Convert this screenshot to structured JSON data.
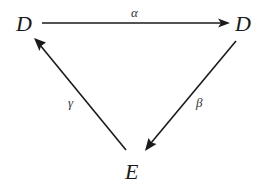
{
  "diagram": {
    "type": "commutative-triangle",
    "nodes": [
      {
        "id": "d_left",
        "label": "D"
      },
      {
        "id": "d_right",
        "label": "D"
      },
      {
        "id": "e_bottom",
        "label": "E"
      }
    ],
    "edges": [
      {
        "id": "alpha",
        "from": "d_left",
        "to": "d_right",
        "label": "α"
      },
      {
        "id": "beta",
        "from": "d_right",
        "to": "e_bottom",
        "label": "β"
      },
      {
        "id": "gamma",
        "from": "e_bottom",
        "to": "d_left",
        "label": "γ"
      }
    ],
    "colors": {
      "ink": "#1a1a1a",
      "label_ink": "#333333",
      "background": "#ffffff"
    }
  }
}
